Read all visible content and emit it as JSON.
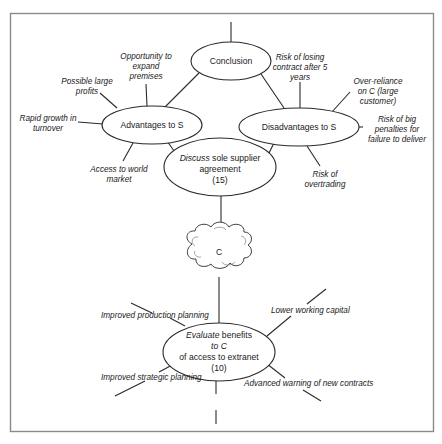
{
  "diagram": {
    "type": "mind-map",
    "central_node": {
      "label": "C"
    },
    "nodes": {
      "conclusion": {
        "label": "Conclusion"
      },
      "advantages": {
        "label": "Advantages to S"
      },
      "disadvantages": {
        "label": "Disadvantages to S"
      },
      "discuss": {
        "line1_verb": "Discuss",
        "line1_rest": " sole supplier",
        "line2": "agreement",
        "line3": "(15)"
      },
      "evaluate": {
        "line1_verb": "Evaluate",
        "line1_rest": " benefits",
        "line2": "to C",
        "line3": "of access to extranet",
        "line4": "(10)"
      }
    },
    "advantages_leaves": [
      {
        "lines": [
          "Opportunity to",
          "expand",
          "premises"
        ]
      },
      {
        "lines": [
          "Possible large",
          "profits"
        ]
      },
      {
        "lines": [
          "Rapid growth in",
          "turnover"
        ]
      },
      {
        "lines": [
          "Access to world",
          "market"
        ]
      }
    ],
    "disadvantages_leaves": [
      {
        "lines": [
          "Risk of losing",
          "contract after 5",
          "years"
        ]
      },
      {
        "lines": [
          "Over-reliance",
          "on C (large",
          "customer)"
        ]
      },
      {
        "lines": [
          "Risk of big",
          "penalties for",
          "failure to deliver"
        ]
      },
      {
        "lines": [
          "Risk of",
          "overtrading"
        ]
      }
    ],
    "evaluate_leaves": [
      {
        "label": "Improved production planning"
      },
      {
        "label": "Improved strategic planning"
      },
      {
        "label": "Lower working capital"
      },
      {
        "label": "Advanced warning of new contracts"
      }
    ],
    "colors": {
      "line": "#2a2a2a",
      "frame": "#8a8a8a",
      "background": "#ffffff"
    }
  }
}
